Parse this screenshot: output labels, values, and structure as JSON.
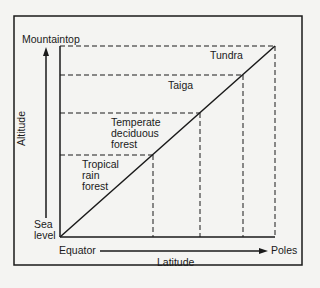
{
  "diagram": {
    "y_axis": {
      "label": "Altitude",
      "top": "Mountaintop",
      "bottom_line1": "Sea",
      "bottom_line2": "level"
    },
    "x_axis": {
      "label": "Latitude",
      "left": "Equator",
      "right": "Poles"
    },
    "zones": [
      {
        "name": "Tropical rain forest",
        "lines": [
          "Tropical",
          "rain",
          "forest"
        ]
      },
      {
        "name": "Temperate deciduous forest",
        "lines": [
          "Temperate",
          "deciduous",
          "forest"
        ]
      },
      {
        "name": "Taiga",
        "lines": [
          "Taiga"
        ]
      },
      {
        "name": "Tundra",
        "lines": [
          "Tundra"
        ]
      }
    ],
    "colors": {
      "ink": "#1a1a1a",
      "background": "#f4f4f2"
    }
  }
}
